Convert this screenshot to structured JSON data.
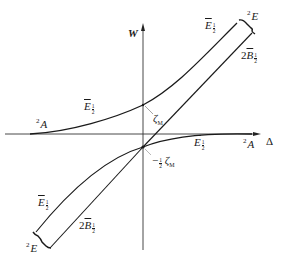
{
  "diagram": {
    "type": "energy-level correlation diagram",
    "axes": {
      "y_label": "W",
      "x_label": "Δ"
    },
    "labels": {
      "left_state": {
        "sup": "2",
        "main": "A"
      },
      "right_state": {
        "sup": "2",
        "main": "A"
      },
      "top_right_state": {
        "sup": "2",
        "main": "E"
      },
      "bottom_left_state": {
        "sup": "2",
        "main": "E"
      },
      "upper_left_curve": {
        "main": "E",
        "num": "1",
        "den": "2"
      },
      "upper_right_curve": {
        "main": "E",
        "num": "1",
        "den": "2"
      },
      "upper_right_line": {
        "prefix": "2",
        "main": "B",
        "num": "1",
        "den": "2"
      },
      "lower_right_curve": {
        "main": "E",
        "num": "1",
        "den": "2"
      },
      "lower_left_curve": {
        "main": "E",
        "num": "1",
        "den": "2"
      },
      "lower_left_line": {
        "prefix": "2",
        "main": "B",
        "num": "1",
        "den": "2"
      },
      "zeta_upper": {
        "main": "ζ",
        "sub": "M"
      },
      "zeta_lower": {
        "prefix": "−",
        "num": "1",
        "den": "2",
        "main": "ζ",
        "sub": "M"
      }
    },
    "colors": {
      "line": "#1a1a1a",
      "axis": "#333333",
      "background": "#ffffff"
    }
  }
}
